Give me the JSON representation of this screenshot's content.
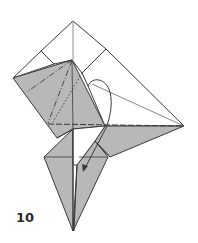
{
  "diagram": {
    "type": "origami-fold-step",
    "step_number": "10",
    "colors": {
      "paper_colored": "#b8b8b8",
      "paper_white": "#ffffff",
      "line": "#3a3a3a",
      "arrow": "#3a3a3a"
    },
    "legend": {
      "dash_dot": "valley/mountain fold line",
      "dashed": "hidden edge",
      "arrow": "fold direction"
    }
  }
}
